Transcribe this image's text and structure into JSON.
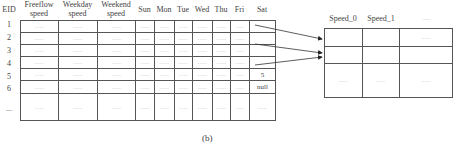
{
  "left_table": {
    "id_header": "EID",
    "headers": [
      "Freeflow speed",
      "Weekday speed",
      "Weekend speed",
      "Sun",
      "Mon",
      "Tue",
      "Wed",
      "Thu",
      "Fri",
      "Sat"
    ],
    "row_ids": [
      "1",
      "2",
      "3",
      "4",
      "5",
      "6",
      "..."
    ],
    "rows": [
      [
        "......",
        "......",
        "......",
        "......",
        "......",
        "......",
        "......",
        "......",
        "......",
        ""
      ],
      [
        "......",
        "......",
        "......",
        "......",
        "......",
        "......",
        "......",
        "......",
        "......",
        ""
      ],
      [
        "......",
        "......",
        "......",
        "......",
        "......",
        "......",
        "......",
        "......",
        "......",
        ""
      ],
      [
        "......",
        "......",
        "......",
        "......",
        "......",
        "......",
        "......",
        "......",
        "......",
        ""
      ],
      [
        "......",
        "......",
        "......",
        "......",
        "......",
        "......",
        "......",
        "......",
        "......",
        "5"
      ],
      [
        "......",
        "......",
        "......",
        "......",
        "......",
        "......",
        "......",
        "......",
        "......",
        "null"
      ],
      [
        "......",
        "......",
        "......",
        "......",
        "......",
        "......",
        "......",
        "......",
        "......",
        "......"
      ]
    ]
  },
  "right_table": {
    "headers": [
      "Speed_0",
      "Speed_1",
      "......"
    ],
    "rows": [
      [
        "",
        "",
        "......"
      ],
      [
        "",
        "",
        ""
      ],
      [
        "......",
        "......",
        "......"
      ]
    ]
  },
  "arrows": [
    {
      "from_row": "1",
      "to_row": 0
    },
    {
      "from_row": "3",
      "to_row": 1
    },
    {
      "from_row": "4",
      "to_row": 1
    }
  ],
  "caption": "(b)"
}
